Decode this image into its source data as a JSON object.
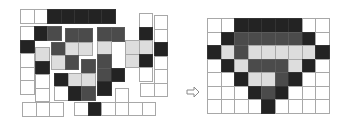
{
  "colors": {
    "white": "#ffffff",
    "light": "#dddddd",
    "medium": "#4b4b4b",
    "dark": "#232323",
    "grid_line": "#a8a8a8"
  },
  "legend": {
    "W": "white",
    "L": "light gray",
    "M": "medium gray",
    "D": "dark"
  },
  "arrow": {
    "icon": "right-arrow-icon",
    "glyph": "⇨"
  },
  "cell_size": 13.5,
  "pieces": [
    {
      "id": "piece-top-bar",
      "x": 20,
      "y": 9,
      "cells": [
        [
          "W",
          "W",
          "D",
          "D",
          "D",
          "D",
          "D"
        ]
      ]
    },
    {
      "id": "piece-left-l",
      "x": 20,
      "y": 26,
      "cells": [
        [
          "W",
          "D",
          "M"
        ],
        [
          "D",
          null,
          null
        ],
        [
          "W",
          null,
          null
        ],
        [
          "W",
          null,
          null
        ],
        [
          "W",
          null,
          null
        ]
      ]
    },
    {
      "id": "piece-left-column",
      "x": 35,
      "y": 47,
      "cells": [
        [
          "L"
        ],
        [
          "D"
        ],
        [
          "W"
        ],
        [
          "W"
        ]
      ]
    },
    {
      "id": "piece-bottom-left",
      "x": 22,
      "y": 102,
      "cells": [
        [
          "W",
          "W",
          "W"
        ]
      ]
    },
    {
      "id": "piece-center-upper",
      "x": 51,
      "y": 28,
      "cells": [
        [
          null,
          "M",
          "M"
        ],
        [
          "M",
          "L",
          "L"
        ],
        [
          "L",
          "M",
          null
        ]
      ]
    },
    {
      "id": "piece-center-lower",
      "x": 54,
      "y": 59,
      "cells": [
        [
          null,
          null,
          "M"
        ],
        [
          "D",
          "L",
          "L"
        ],
        [
          "W",
          "D",
          "M"
        ]
      ]
    },
    {
      "id": "piece-center-right",
      "x": 97,
      "y": 27,
      "cells": [
        [
          "M",
          "M"
        ],
        [
          "L",
          null
        ],
        [
          "M",
          null
        ],
        [
          "M",
          "D"
        ],
        [
          "D",
          null
        ]
      ]
    },
    {
      "id": "piece-right-t",
      "x": 125,
      "y": 13,
      "cells": [
        [
          null,
          "W"
        ],
        [
          null,
          "D"
        ],
        [
          "L",
          "L"
        ],
        [
          "L",
          "D"
        ],
        [
          null,
          "W"
        ]
      ]
    },
    {
      "id": "piece-far-right",
      "x": 140,
      "y": 15,
      "cells": [
        [
          null,
          "W"
        ],
        [
          null,
          "W"
        ],
        [
          null,
          "D"
        ],
        [
          null,
          "W"
        ],
        [
          null,
          "W"
        ],
        [
          "W",
          "W"
        ]
      ]
    },
    {
      "id": "piece-bottom-right",
      "x": 74,
      "y": 88,
      "cells": [
        [
          null,
          null,
          null,
          "W",
          null,
          null
        ],
        [
          "W",
          "D",
          "W",
          "W",
          "W",
          "W"
        ]
      ]
    }
  ],
  "target": {
    "x": 207,
    "y": 18,
    "cols": 9,
    "rows": 7,
    "grid": [
      [
        "W",
        "W",
        "D",
        "D",
        "D",
        "D",
        "D",
        "W",
        "W"
      ],
      [
        "W",
        "D",
        "M",
        "M",
        "M",
        "M",
        "M",
        "D",
        "W"
      ],
      [
        "D",
        "L",
        "M",
        "L",
        "L",
        "L",
        "L",
        "L",
        "D"
      ],
      [
        "W",
        "D",
        "L",
        "M",
        "M",
        "M",
        "L",
        "D",
        "W"
      ],
      [
        "W",
        "W",
        "D",
        "L",
        "L",
        "M",
        "D",
        "W",
        "W"
      ],
      [
        "W",
        "W",
        "W",
        "D",
        "M",
        "D",
        "W",
        "W",
        "W"
      ],
      [
        "W",
        "W",
        "W",
        "W",
        "D",
        "W",
        "W",
        "W",
        "W"
      ]
    ]
  }
}
